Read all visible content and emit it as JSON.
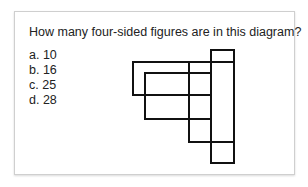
{
  "question": "How many four-sided figures are in this diagram?",
  "options": [
    {
      "letter": "a.",
      "value": "10"
    },
    {
      "letter": "b.",
      "value": "16"
    },
    {
      "letter": "c.",
      "value": "25"
    },
    {
      "letter": "d.",
      "value": "28"
    }
  ],
  "diagram": {
    "stroke_color": "#111111",
    "stroke_width": 2
  }
}
